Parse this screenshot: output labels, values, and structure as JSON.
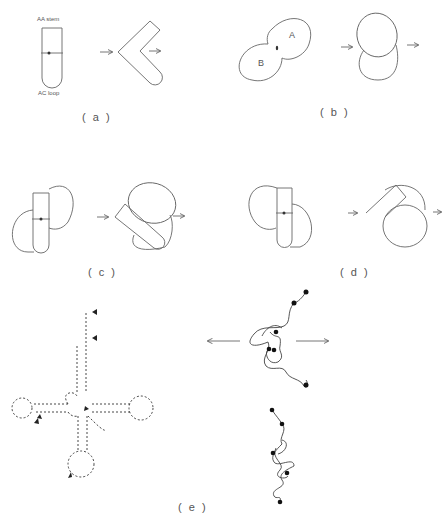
{
  "figure": {
    "panels": [
      {
        "id": "a",
        "label": "( a )",
        "annotations": {
          "top": "AA stem",
          "bottom": "AC loop"
        }
      },
      {
        "id": "b",
        "label": "( b )",
        "annotations": {
          "lobe_a": "A",
          "lobe_b": "B"
        }
      },
      {
        "id": "c",
        "label": "( c )"
      },
      {
        "id": "d",
        "label": "( d )"
      },
      {
        "id": "e",
        "label": "( e )"
      }
    ]
  }
}
